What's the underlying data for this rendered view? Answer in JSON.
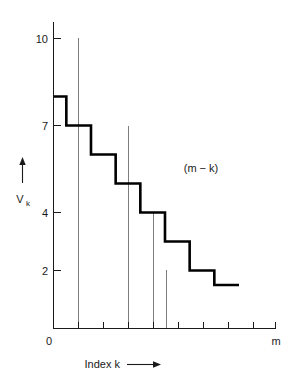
{
  "chart_data": {
    "type": "line",
    "subtype": "step",
    "title": "",
    "xlabel": "Index k",
    "ylabel": "V",
    "ylabel_subscript": "k",
    "annotation": "(m − k)",
    "grid": false,
    "legend": null,
    "x_axis": {
      "label": "Index k",
      "label_arrow": "⟶",
      "origin_label": "0",
      "end_label": "m",
      "tick_count": 9,
      "tick_positions": [
        0,
        1,
        2,
        3,
        4,
        5,
        6,
        7,
        8,
        9
      ],
      "tick_labels": [
        "0",
        "",
        "",
        "",
        "",
        "",
        "",
        "",
        "",
        "m"
      ],
      "range": [
        0,
        9
      ]
    },
    "y_axis": {
      "tick_values": [
        10,
        7,
        4,
        2
      ],
      "tick_labels": [
        "10",
        "7",
        "4",
        "2"
      ],
      "range": [
        0,
        11.5
      ]
    },
    "step_series": {
      "name": "V_k",
      "x_breakpoints": [
        0.0,
        0.52,
        1.52,
        2.52,
        3.52,
        4.52,
        5.52,
        6.52,
        7.52,
        9.0
      ],
      "values": [
        8.0,
        7.0,
        6.0,
        5.0,
        4.0,
        3.0,
        2.0,
        1.5
      ]
    },
    "helper_lines": [
      {
        "x": 1.0,
        "y_top": 10.2,
        "y_bottom": 0
      },
      {
        "x": 3.0,
        "y_top": 7.05,
        "y_bottom": 0
      },
      {
        "x": 4.0,
        "y_top": 4.05,
        "y_bottom": 0
      },
      {
        "x": 4.5,
        "y_top": 2.05,
        "y_bottom": 0
      }
    ]
  }
}
